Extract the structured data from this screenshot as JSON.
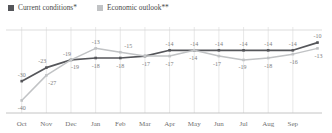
{
  "legend": {
    "position": "top-left",
    "items": [
      {
        "label": "Current conditions*",
        "color": "#55565a"
      },
      {
        "label": "Economic outlook**",
        "color": "#c1c3c5"
      }
    ]
  },
  "axis": {
    "grid_color": "#dedede",
    "baseline_color": "#bdbdbd",
    "topline_color": "#d4d4d4",
    "tick_color": "#6f6f6f"
  },
  "chart_data": {
    "type": "line",
    "title": "",
    "xlabel": "",
    "ylabel": "",
    "ylim": [
      -46,
      -4
    ],
    "grid": "vertical-only",
    "legend_position": "top-left",
    "data_labels": true,
    "categories": [
      "Oct",
      "Nov",
      "Dec",
      "Jan",
      "Feb",
      "Mar",
      "Apr",
      "May",
      "Jun",
      "Jul",
      "Aug",
      "Sep",
      ""
    ],
    "gridline_count": 12,
    "series": [
      {
        "name": "Current conditions*",
        "color": "#55565a",
        "width": 1.7,
        "marker": true,
        "values": [
          -30,
          -23,
          -19,
          -18,
          -18,
          -17,
          -14,
          -14,
          -14,
          -14,
          -14,
          -14,
          -10
        ],
        "label_pos": [
          "above",
          "above",
          "above",
          "below",
          "below",
          "below",
          "above",
          "above",
          "above",
          "above",
          "above",
          "above",
          "above"
        ],
        "label_dx": [
          0,
          -4,
          -4,
          0,
          0,
          1,
          0,
          0,
          0,
          0,
          0,
          0,
          0
        ]
      },
      {
        "name": "Economic outlook**",
        "color": "#c1c3c5",
        "width": 1.5,
        "marker": true,
        "values": [
          -40,
          -27,
          -19,
          -13,
          -15,
          -17,
          -17,
          -14,
          -17,
          -19,
          -18,
          -16,
          -13
        ],
        "label_pos": [
          "below",
          "below",
          "below",
          "above",
          "above",
          "hidden",
          "below",
          "below",
          "below",
          "below",
          "below",
          "below",
          "below"
        ],
        "label_dx": [
          0,
          6,
          4,
          0,
          8,
          0,
          0,
          -1,
          -2,
          -1,
          0,
          1,
          1
        ]
      }
    ]
  }
}
